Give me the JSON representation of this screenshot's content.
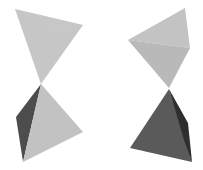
{
  "figure": {
    "background": "#ffffff",
    "colors": {
      "light": "#c4c4c4",
      "light_shade": "#bdbdbd",
      "mid": "#b3b3b3",
      "dark": "#595959",
      "darker": "#3a3a3a"
    },
    "pairs": [
      {
        "name": "left-pair",
        "top": {
          "faces": [
            {
              "points": "15,9 83,25 41,84",
              "fill": "#c6c6c6"
            },
            {
              "points": "15,9 83,25 60,40",
              "fill": "#c9c9c9"
            }
          ]
        },
        "bottom": {
          "faces": [
            {
              "points": "41,84 16,117 23,162",
              "fill": "#4d4d4d"
            },
            {
              "points": "41,84 23,162 83,132",
              "fill": "#c2c2c2"
            }
          ]
        }
      },
      {
        "name": "right-pair",
        "top": {
          "faces": [
            {
              "points": "185,8 128,40 190,48",
              "fill": "#c3c3c3"
            },
            {
              "points": "128,40 190,48 169,88",
              "fill": "#b9b9b9"
            }
          ]
        },
        "bottom": {
          "faces": [
            {
              "points": "169,89 130,148 192,162",
              "fill": "#5a5a5a"
            },
            {
              "points": "169,89 188,123 192,162 184,140",
              "fill": "#2e2e2e"
            }
          ]
        }
      }
    ]
  }
}
